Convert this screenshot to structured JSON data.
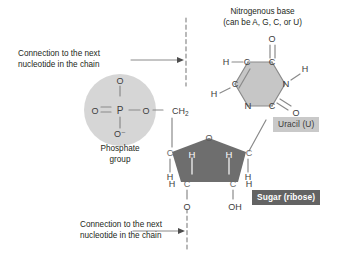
{
  "figure": {
    "kind": "nucleotide-structure-diagram",
    "background": "#ffffff",
    "colors": {
      "phosphate_circle": "#d6d6d6",
      "base_hexagon": "#c6c6c6",
      "sugar_pentagon": "#6e6e6e",
      "bond": "#8a8a8a",
      "text": "#231f20",
      "badge_uracil_bg": "#c9c9c9",
      "badge_uracil_text": "#3a3a3a",
      "badge_sugar_bg": "#636363",
      "badge_sugar_text": "#ffffff"
    }
  },
  "annotations": {
    "base_title_line1": "Nitrogenous base",
    "base_title_line2": "(can be A, G, C, or U)",
    "phosphate_label_line1": "Phosphate",
    "phosphate_label_line2": "group",
    "top_connection_line1": "Connection to the next",
    "top_connection_line2": "nucleotide in the chain",
    "bottom_connection_line1": "Connection to the next",
    "bottom_connection_line2": "nucleotide in the chain"
  },
  "badges": {
    "uracil": "Uracil (U)",
    "sugar": "Sugar (ribose)"
  },
  "phosphate_group": {
    "center_atom": "P",
    "top_oxygen": "O",
    "left_oxygen": "O",
    "bottom_oxygen": "O–",
    "right_oxygen": "O",
    "methylene": "CH",
    "methylene_subscript": "2"
  },
  "base_uracil": {
    "ring_atoms": [
      {
        "id": "c5",
        "label": "C"
      },
      {
        "id": "c4",
        "label": "C"
      },
      {
        "id": "n3",
        "label": "N"
      },
      {
        "id": "c2",
        "label": "C"
      },
      {
        "id": "n1",
        "label": "N"
      },
      {
        "id": "c6",
        "label": "C"
      }
    ],
    "substituents": [
      {
        "id": "h5",
        "label": "H"
      },
      {
        "id": "h6",
        "label": "H"
      },
      {
        "id": "h3",
        "label": "H"
      },
      {
        "id": "o4",
        "label": "O"
      },
      {
        "id": "o2",
        "label": "O"
      }
    ]
  },
  "sugar_ribose": {
    "ring_atoms": [
      {
        "id": "o4prime",
        "label": "O"
      },
      {
        "id": "c4prime",
        "label": "C"
      },
      {
        "id": "c3prime",
        "label": "C"
      },
      {
        "id": "c2prime",
        "label": "C"
      },
      {
        "id": "c1prime",
        "label": "C"
      }
    ],
    "inner_hydrogens": [
      {
        "id": "h-left",
        "label": "H"
      },
      {
        "id": "h-right",
        "label": "H"
      }
    ],
    "outer_hydrogens": [
      {
        "id": "h-c4",
        "label": "H"
      },
      {
        "id": "h-c3",
        "label": "H"
      },
      {
        "id": "h-c1",
        "label": "H"
      },
      {
        "id": "h-c2",
        "label": "H"
      }
    ],
    "bottom_oxygen": "O",
    "hydroxyl": "OH"
  }
}
